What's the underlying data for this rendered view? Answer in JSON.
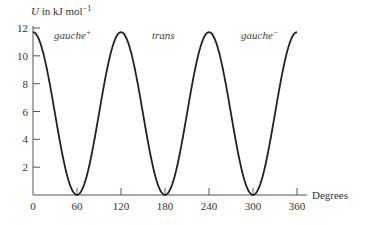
{
  "chart_data": {
    "type": "line",
    "title": "",
    "xlabel": "Degrees",
    "ylabel": "U in kJ mol⁻¹",
    "ylabel_parts": {
      "var": "U",
      "text": " in kJ mol",
      "sup": "−1"
    },
    "xlim": [
      0,
      360
    ],
    "ylim": [
      0,
      12
    ],
    "grid": false,
    "legend": null,
    "x_ticks": [
      0,
      60,
      120,
      180,
      240,
      300,
      360
    ],
    "y_ticks": [
      2,
      4,
      6,
      8,
      10,
      12
    ],
    "x_tick_labels": [
      "0",
      "60",
      "120",
      "180",
      "240",
      "300",
      "360"
    ],
    "y_tick_labels": [
      "2",
      "4",
      "6",
      "8",
      "10",
      "12"
    ],
    "series": [
      {
        "name": "U",
        "x": [
          0,
          30,
          60,
          90,
          120,
          150,
          180,
          210,
          240,
          270,
          300,
          330,
          360
        ],
        "y": [
          11.7,
          5.85,
          0,
          5.85,
          11.7,
          5.85,
          0,
          5.85,
          11.7,
          5.85,
          0,
          5.85,
          11.7
        ]
      }
    ],
    "annotations": [
      {
        "text": "gauche",
        "sup": "+",
        "x": 60
      },
      {
        "text": "trans",
        "sup": "",
        "x": 180
      },
      {
        "text": "gauche",
        "sup": "−",
        "x": 300
      }
    ]
  }
}
